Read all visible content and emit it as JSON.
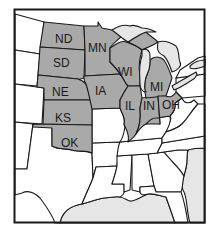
{
  "map": {
    "region": "Midwest United States",
    "highlight_color": "#a9a9a9",
    "water_color": "#e6e6e6",
    "outline_color": "#1a1a1a",
    "background_color": "#ffffff",
    "highlighted_states": [
      {
        "abbr": "ND",
        "label": "ND"
      },
      {
        "abbr": "SD",
        "label": "SD"
      },
      {
        "abbr": "NE",
        "label": "NE"
      },
      {
        "abbr": "KS",
        "label": "KS"
      },
      {
        "abbr": "OK",
        "label": "OK"
      },
      {
        "abbr": "MN",
        "label": "MN"
      },
      {
        "abbr": "IA",
        "label": "IA"
      },
      {
        "abbr": "WI",
        "label": "WI"
      },
      {
        "abbr": "IL",
        "label": "IL"
      },
      {
        "abbr": "IN",
        "label": "IN"
      },
      {
        "abbr": "MI",
        "label": "MI"
      },
      {
        "abbr": "OH",
        "label": "OH"
      }
    ]
  }
}
